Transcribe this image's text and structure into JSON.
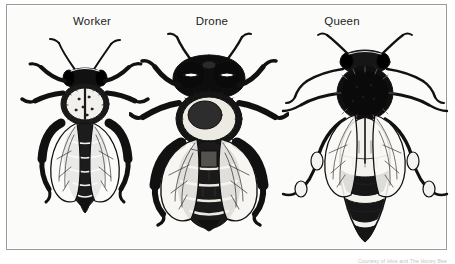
{
  "figure": {
    "background_color": "#fbfbfa",
    "frame_color": "#9a9a9a",
    "ink_color": "#111111",
    "attribution": "Courtesy of Hive and The Honey Bee"
  },
  "labels": {
    "worker": "Worker",
    "drone": "Drone",
    "queen": "Queen"
  },
  "specimens": [
    {
      "id": "worker",
      "label": "Worker",
      "caste": "worker",
      "relative_size": "smallest",
      "body_length_ratio": 1.0,
      "eye_type": "small lateral compound eyes",
      "abdomen": "pointed, dark banded",
      "notes": "sterile female, narrow body, pollen baskets on hind legs"
    },
    {
      "id": "drone",
      "label": "Drone",
      "caste": "drone",
      "relative_size": "stout",
      "body_length_ratio": 1.25,
      "eye_type": "very large compound eyes meeting at top of head",
      "abdomen": "blunt, broad, heavily banded",
      "notes": "male, thick furry thorax, blunt rounded abdomen"
    },
    {
      "id": "queen",
      "label": "Queen",
      "caste": "queen",
      "relative_size": "longest",
      "body_length_ratio": 1.35,
      "eye_type": "small lateral compound eyes",
      "abdomen": "long, tapering, pale banded",
      "notes": "fertile female, elongated abdomen extending past wing tips"
    }
  ]
}
